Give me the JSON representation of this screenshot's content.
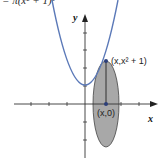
{
  "figure": {
    "top_formula_partial": "= π(x² + 1)²",
    "axis_labels": {
      "x": "x",
      "y": "y"
    },
    "point_labels": {
      "curve_point": "(x,x² + 1)",
      "axis_point": "(x,0)"
    },
    "colors": {
      "curve": "#5b79b8",
      "disk_fill": "#a8a8a8",
      "axis": "#333333",
      "point": "#2c3f7a"
    },
    "curve": "y = x² + 1",
    "shape": "cross-section disk of revolution about x-axis"
  }
}
